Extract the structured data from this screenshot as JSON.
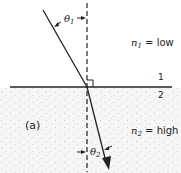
{
  "figure": {
    "panel_label": "(a)",
    "medium1": {
      "index_label": "n",
      "index_sub": "1",
      "relation": " = low",
      "boundary_label": "1"
    },
    "medium2": {
      "index_label": "n",
      "index_sub": "2",
      "relation": " = high",
      "boundary_label": "2"
    },
    "angles": {
      "incident": {
        "symbol": "θ",
        "sub": "1"
      },
      "refracted": {
        "symbol": "θ",
        "sub": "2"
      }
    },
    "colors": {
      "line": "#222222",
      "medium2_fill": "#f4f4f4",
      "stipple": "#b9b9b9"
    }
  }
}
